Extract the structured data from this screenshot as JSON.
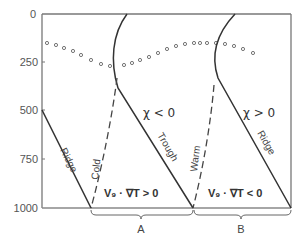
{
  "figure": {
    "y_axis": {
      "ticks": [
        "0",
        "250",
        "500",
        "750",
        "1000"
      ]
    },
    "labels": {
      "ridge_left": "Ridge",
      "cold": "Cold",
      "trough": "Trough",
      "warm": "Warm",
      "ridge_right": "Ridge",
      "chi_negative": "χ < 0",
      "chi_positive": "χ > 0",
      "advection_positive": "V₉ · ∇T > 0",
      "advection_negative": "V₉ · ∇T < 0",
      "region_a": "A",
      "region_b": "B"
    },
    "colors": {
      "line": "#333333",
      "axis": "#777777",
      "dots": "#666666"
    }
  }
}
